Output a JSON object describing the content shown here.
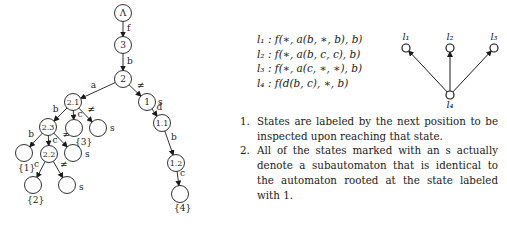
{
  "tree": {
    "nodes": [
      {
        "id": "root",
        "label": "Λ",
        "x": 123,
        "y": 13
      },
      {
        "id": "n3",
        "label": "3",
        "x": 123,
        "y": 45
      },
      {
        "id": "n2",
        "label": "2",
        "x": 123,
        "y": 79
      },
      {
        "id": "n21",
        "label": "2.1",
        "x": 73,
        "y": 102
      },
      {
        "id": "n1",
        "label": "1",
        "x": 147,
        "y": 102
      },
      {
        "id": "n23",
        "label": "2.3",
        "x": 48,
        "y": 127
      },
      {
        "id": "leaf3",
        "label": "",
        "x": 74,
        "y": 128
      },
      {
        "id": "s21",
        "label": "",
        "x": 98,
        "y": 128
      },
      {
        "id": "n11",
        "label": "1.1",
        "x": 162,
        "y": 123
      },
      {
        "id": "leaf1",
        "label": "",
        "x": 24,
        "y": 153
      },
      {
        "id": "n22",
        "label": "2.2",
        "x": 49,
        "y": 154
      },
      {
        "id": "s23",
        "label": "",
        "x": 73,
        "y": 153
      },
      {
        "id": "n12",
        "label": "1.2",
        "x": 176,
        "y": 163
      },
      {
        "id": "leaf2",
        "label": "",
        "x": 33,
        "y": 185
      },
      {
        "id": "s22",
        "label": "",
        "x": 67,
        "y": 185
      },
      {
        "id": "leaf4",
        "label": "",
        "x": 180,
        "y": 194
      }
    ],
    "edges": [
      {
        "from": "root",
        "to": "n3",
        "label": "f"
      },
      {
        "from": "n3",
        "to": "n2",
        "label": "b"
      },
      {
        "from": "n2",
        "to": "n21",
        "label": "a"
      },
      {
        "from": "n2",
        "to": "n1",
        "label": "≠"
      },
      {
        "from": "n21",
        "to": "n23",
        "label": "b"
      },
      {
        "from": "n21",
        "to": "leaf3",
        "label": "c"
      },
      {
        "from": "n21",
        "to": "s21",
        "label": "≠"
      },
      {
        "from": "n23",
        "to": "leaf1",
        "label": "b"
      },
      {
        "from": "n23",
        "to": "n22",
        "label": "c"
      },
      {
        "from": "n23",
        "to": "s23",
        "label": "≠"
      },
      {
        "from": "n22",
        "to": "leaf2",
        "label": "c"
      },
      {
        "from": "n22",
        "to": "s22",
        "label": "≠"
      },
      {
        "from": "n1",
        "to": "n11",
        "label": "d"
      },
      {
        "from": "n11",
        "to": "n12",
        "label": "b"
      },
      {
        "from": "n12",
        "to": "leaf4",
        "label": "c"
      }
    ],
    "annotations": [
      {
        "text": "s",
        "x": 158,
        "y": 105
      },
      {
        "text": "s",
        "x": 110,
        "y": 131
      },
      {
        "text": "s",
        "x": 85,
        "y": 157
      },
      {
        "text": "s",
        "x": 79,
        "y": 190
      },
      {
        "text": "{3}",
        "x": 75,
        "y": 145
      },
      {
        "text": "{1}",
        "x": 18,
        "y": 171
      },
      {
        "text": "{2}",
        "x": 27,
        "y": 203
      },
      {
        "text": "{4}",
        "x": 174,
        "y": 211
      }
    ]
  },
  "formulas": [
    {
      "name": "l1",
      "text": "l₁ : f(∗, a(b, ∗, b), b)"
    },
    {
      "name": "l2",
      "text": "l₂ : f(∗, a(b, c, c), b)"
    },
    {
      "name": "l3",
      "text": "l₃ : f(∗, a(c, ∗, ∗), b)"
    },
    {
      "name": "l4",
      "text": "l₄ : f(d(b, c), ∗, b)"
    }
  ],
  "dag": {
    "nodes": [
      {
        "id": "l1",
        "label": "l₁",
        "x": 16,
        "y": 28
      },
      {
        "id": "l2",
        "label": "l₂",
        "x": 60,
        "y": 28
      },
      {
        "id": "l3",
        "label": "l₃",
        "x": 104,
        "y": 28
      },
      {
        "id": "l4",
        "label": "l₄",
        "x": 60,
        "y": 75
      }
    ],
    "edges": [
      {
        "from": "l4",
        "to": "l1"
      },
      {
        "from": "l4",
        "to": "l2"
      },
      {
        "from": "l4",
        "to": "l3"
      }
    ]
  },
  "notes": [
    {
      "num": "1.",
      "text": "States are labeled by the next position to be inspected upon reaching that state."
    },
    {
      "num": "2.",
      "text": "All of the states marked with an s actually denote a subautomaton that is identical to the automaton rooted at the state labeled with 1."
    }
  ]
}
